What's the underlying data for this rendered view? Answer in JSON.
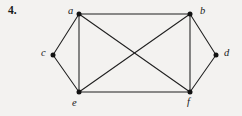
{
  "figure": {
    "exercise_number": "4.",
    "caption": "",
    "background_color": "#f3f2f0",
    "ink_color": "#1f1f1f"
  },
  "chart_data": {
    "type": "diagram",
    "subtype": "undirected-graph",
    "title": "4.",
    "vertex_count": 6,
    "edge_count": 9,
    "vertices": [
      {
        "id": "a",
        "label": "a",
        "x": 79,
        "y": 14,
        "label_x": 68,
        "label_y": 6
      },
      {
        "id": "b",
        "label": "b",
        "x": 190,
        "y": 14,
        "label_x": 200,
        "label_y": 6
      },
      {
        "id": "c",
        "label": "c",
        "x": 53,
        "y": 55,
        "label_x": 41,
        "label_y": 48
      },
      {
        "id": "d",
        "label": "d",
        "x": 216,
        "y": 55,
        "label_x": 224,
        "label_y": 48
      },
      {
        "id": "e",
        "label": "e",
        "x": 79,
        "y": 92,
        "label_x": 72,
        "label_y": 98
      },
      {
        "id": "f",
        "label": "f",
        "x": 190,
        "y": 92,
        "label_x": 187,
        "label_y": 97
      }
    ],
    "edges": [
      {
        "from": "a",
        "to": "b"
      },
      {
        "from": "a",
        "to": "c"
      },
      {
        "from": "a",
        "to": "e"
      },
      {
        "from": "a",
        "to": "f"
      },
      {
        "from": "b",
        "to": "d"
      },
      {
        "from": "b",
        "to": "e"
      },
      {
        "from": "b",
        "to": "f"
      },
      {
        "from": "c",
        "to": "e"
      },
      {
        "from": "d",
        "to": "f"
      },
      {
        "from": "e",
        "to": "f"
      }
    ],
    "vertex_degrees": {
      "a": 4,
      "b": 4,
      "c": 2,
      "d": 2,
      "e": 4,
      "f": 4
    },
    "xlabel": "",
    "ylabel": "",
    "grid": false,
    "legend": null
  }
}
